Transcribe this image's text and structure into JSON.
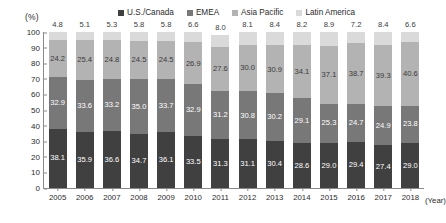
{
  "axis": {
    "y_unit": "(%)",
    "x_unit": "(Year)",
    "y_ticks": [
      "100",
      "90",
      "80",
      "70",
      "60",
      "50",
      "40",
      "30",
      "20",
      "10",
      "0"
    ]
  },
  "chart_data": {
    "type": "bar",
    "subtype": "stacked-percentage-column",
    "title": "",
    "subtitle": "",
    "xlabel": "(Year)",
    "ylabel": "(%)",
    "ylim": [
      0,
      100
    ],
    "ytick_step": 10,
    "grid": false,
    "legend_position": "top",
    "categories": [
      "2005",
      "2006",
      "2007",
      "2008",
      "2009",
      "2010",
      "2011",
      "2012",
      "2013",
      "2014",
      "2015",
      "2016",
      "2017",
      "2018"
    ],
    "series": [
      {
        "name": "U.S./Canada",
        "color": "#404040",
        "values": [
          38.1,
          35.9,
          36.6,
          34.7,
          36.1,
          33.5,
          31.3,
          31.1,
          30.4,
          28.6,
          29.0,
          29.4,
          27.4,
          29.0
        ]
      },
      {
        "name": "EMEA",
        "color": "#787878",
        "values": [
          32.9,
          33.6,
          33.2,
          35.0,
          33.7,
          32.9,
          31.2,
          30.8,
          30.2,
          29.1,
          25.3,
          24.7,
          24.9,
          23.8
        ]
      },
      {
        "name": "Asia Pacific",
        "color": "#b3b3b3",
        "values": [
          24.2,
          25.4,
          24.8,
          24.5,
          24.5,
          26.9,
          27.6,
          30.0,
          30.9,
          34.1,
          37.1,
          38.7,
          39.3,
          40.6
        ]
      },
      {
        "name": "Latin America",
        "color": "#dadada",
        "values": [
          4.8,
          5.1,
          5.3,
          5.8,
          5.8,
          6.6,
          8.0,
          8.1,
          8.4,
          8.2,
          8.9,
          7.2,
          8.4,
          6.6
        ]
      }
    ]
  }
}
